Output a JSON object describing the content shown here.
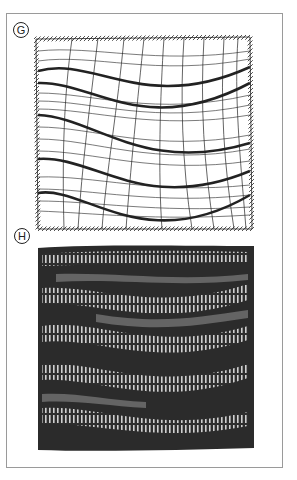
{
  "figure": {
    "panels": [
      {
        "id": "G",
        "label": "G",
        "kind": "line-drawing",
        "description": "Distorted grid drawing with wavy thick horizontal bands and hatched border"
      },
      {
        "id": "H",
        "label": "H",
        "kind": "photo",
        "description": "Dark knitted/woven fabric sample with wavy ladder bands"
      }
    ],
    "colors": {
      "frame": "#9a9a9a",
      "ink": "#1a1a1a",
      "fabric_dark": "#2b2b2b",
      "fabric_light": "#bdbdbd"
    }
  }
}
